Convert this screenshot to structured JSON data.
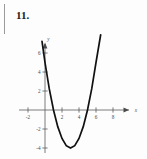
{
  "figure": {
    "exercise_number": "11.",
    "background_color": "#fdfdfd",
    "curve_color": "#111111",
    "axis_color": "#5a5a5a"
  },
  "chart_data": {
    "type": "line",
    "title": "",
    "subtitle": "",
    "xlabel": "x",
    "ylabel": "y",
    "function": "y = x^2 - 6x + 5",
    "vertex": [
      3,
      -4
    ],
    "roots": [
      1,
      5
    ],
    "y_intercept": 5,
    "xlim": [
      -3,
      9.5
    ],
    "ylim": [
      -5,
      7.5
    ],
    "grid": false,
    "legend": null,
    "x_ticks": [
      -2,
      2,
      4,
      6,
      8
    ],
    "x_tick_labels": [
      "-2",
      "2",
      "4",
      "6",
      "8"
    ],
    "y_ticks": [
      6,
      4,
      2,
      -2,
      -4
    ],
    "y_tick_labels": [
      "6",
      "4",
      "2",
      "-2",
      "-4"
    ],
    "x_domain_drawn": [
      -0.35,
      6.55
    ],
    "x": [
      -0.35,
      0,
      0.5,
      1,
      1.5,
      2,
      2.5,
      3,
      3.5,
      4,
      4.5,
      5,
      5.5,
      6,
      6.55
    ],
    "y": [
      7.22,
      5,
      2.25,
      0,
      -1.75,
      -3,
      -3.75,
      -4,
      -3.75,
      -3,
      -1.75,
      0,
      2.25,
      5,
      7.92
    ]
  }
}
